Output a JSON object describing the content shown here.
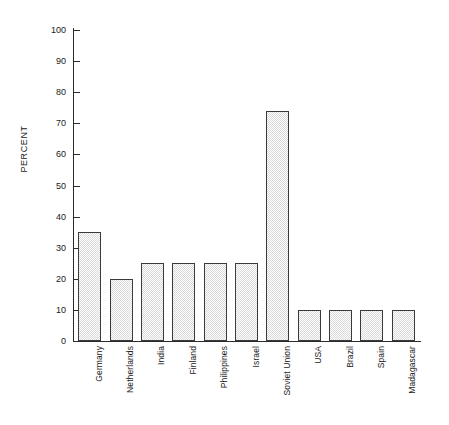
{
  "chart_data": {
    "type": "bar",
    "title": "",
    "subtitle": "",
    "xlabel": "",
    "ylabel": "PERCENT",
    "ylim": [
      0,
      100
    ],
    "ytick_step": 10,
    "yticks": [
      0,
      10,
      20,
      30,
      40,
      50,
      60,
      70,
      80,
      90,
      100
    ],
    "grid": false,
    "legend": null,
    "orientation": "vertical",
    "categories": [
      "Germany",
      "Netherlands",
      "India",
      "Finland",
      "Philippines",
      "Israel",
      "Soviet Union",
      "USA",
      "Brazil",
      "Spain",
      "Madagascar"
    ],
    "values": [
      35,
      20,
      25,
      25,
      25,
      25,
      74,
      10,
      10,
      10,
      10
    ],
    "bar_style": {
      "fill": "#d9d9d9",
      "pattern": "stippled-dots",
      "border": "#3a3a3a"
    },
    "axis_color": "#2b2b2b",
    "background": "#ffffff",
    "label_rotation_deg": -90
  }
}
